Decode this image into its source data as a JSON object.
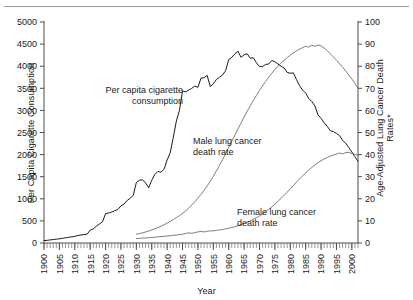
{
  "figure": {
    "top_rule": true,
    "background": "#ffffff"
  },
  "chart_data": {
    "type": "line",
    "title": "",
    "xlabel": "Year",
    "ylabel": "Per Capita Cigarette Consumption",
    "ylabel_right_line1": "Age-Adjusted Lung Cancer Death",
    "ylabel_right_line2": "Rates*",
    "xlim": [
      1900,
      2002
    ],
    "ylim": [
      0,
      5000
    ],
    "ylim_right": [
      0,
      100
    ],
    "grid": false,
    "legend": "inline-annotations",
    "xticks": [
      1900,
      1905,
      1910,
      1915,
      1920,
      1925,
      1930,
      1935,
      1940,
      1945,
      1950,
      1955,
      1960,
      1965,
      1970,
      1975,
      1980,
      1985,
      1990,
      1995,
      2000
    ],
    "xtick_labels": [
      "1900",
      "1905",
      "1910",
      "1915",
      "1920",
      "1925",
      "1930",
      "1935",
      "1940",
      "1945",
      "1950",
      "1955",
      "1960",
      "1965",
      "1970",
      "1975",
      "1980",
      "1985",
      "1990",
      "1995",
      "2000"
    ],
    "xtick_minor_step": 1,
    "yticks_left": [
      0,
      500,
      1000,
      1500,
      2000,
      2500,
      3000,
      3500,
      4000,
      4500,
      5000
    ],
    "ytick_labels_left": [
      "0",
      "500",
      "1000",
      "1500",
      "2000",
      "2500",
      "3000",
      "3500",
      "4000",
      "4500",
      "5000"
    ],
    "yticks_right": [
      0,
      10,
      20,
      30,
      40,
      50,
      60,
      70,
      80,
      90,
      100
    ],
    "ytick_labels_right": [
      "0",
      "10",
      "20",
      "30",
      "40",
      "50",
      "60",
      "70",
      "80",
      "90",
      "100"
    ],
    "series": [
      {
        "name": "Per capita cigarette consumption",
        "axis": "left",
        "color": "#1a1a1a",
        "x": [
          1900,
          1901,
          1902,
          1903,
          1904,
          1905,
          1906,
          1907,
          1908,
          1909,
          1910,
          1911,
          1912,
          1913,
          1914,
          1915,
          1916,
          1917,
          1918,
          1919,
          1920,
          1921,
          1922,
          1923,
          1924,
          1925,
          1926,
          1927,
          1928,
          1929,
          1930,
          1931,
          1932,
          1933,
          1934,
          1935,
          1936,
          1937,
          1938,
          1939,
          1940,
          1941,
          1942,
          1943,
          1944,
          1945,
          1946,
          1947,
          1948,
          1949,
          1950,
          1951,
          1952,
          1953,
          1954,
          1955,
          1956,
          1957,
          1958,
          1959,
          1960,
          1961,
          1962,
          1963,
          1964,
          1965,
          1966,
          1967,
          1968,
          1969,
          1970,
          1971,
          1972,
          1973,
          1974,
          1975,
          1976,
          1977,
          1978,
          1979,
          1980,
          1981,
          1982,
          1983,
          1984,
          1985,
          1986,
          1987,
          1988,
          1989,
          1990,
          1991,
          1992,
          1993,
          1994,
          1995,
          1996,
          1997,
          1998,
          1999,
          2000,
          2001,
          2002
        ],
        "y": [
          54,
          60,
          70,
          78,
          86,
          95,
          105,
          118,
          130,
          138,
          151,
          170,
          180,
          190,
          200,
          290,
          320,
          380,
          430,
          480,
          665,
          680,
          700,
          730,
          760,
          840,
          880,
          960,
          1010,
          1080,
          1370,
          1420,
          1430,
          1360,
          1250,
          1420,
          1550,
          1620,
          1600,
          1670,
          1880,
          2040,
          2390,
          2760,
          3000,
          3440,
          3420,
          3460,
          3500,
          3550,
          3520,
          3730,
          3740,
          3790,
          3540,
          3600,
          3700,
          3750,
          3800,
          3900,
          4150,
          4200,
          4280,
          4340,
          4200,
          4260,
          4280,
          4180,
          4190,
          4080,
          3990,
          3990,
          4040,
          4050,
          4130,
          4100,
          4050,
          4000,
          3960,
          3860,
          3840,
          3850,
          3700,
          3560,
          3460,
          3390,
          3270,
          3200,
          3100,
          2900,
          2820,
          2720,
          2640,
          2540,
          2520,
          2480,
          2430,
          2320,
          2260,
          2160,
          2060,
          1950,
          1850
        ],
        "label_line1": "Per capita cigarette",
        "label_line2": "consumption"
      },
      {
        "name": "Male lung cancer death rate",
        "axis": "right",
        "color": "#6e6e6e",
        "x": [
          1930,
          1931,
          1932,
          1933,
          1934,
          1935,
          1936,
          1937,
          1938,
          1939,
          1940,
          1941,
          1942,
          1943,
          1944,
          1945,
          1946,
          1947,
          1948,
          1949,
          1950,
          1951,
          1952,
          1953,
          1954,
          1955,
          1956,
          1957,
          1958,
          1959,
          1960,
          1961,
          1962,
          1963,
          1964,
          1965,
          1966,
          1967,
          1968,
          1969,
          1970,
          1971,
          1972,
          1973,
          1974,
          1975,
          1976,
          1977,
          1978,
          1979,
          1980,
          1981,
          1982,
          1983,
          1984,
          1985,
          1986,
          1987,
          1988,
          1989,
          1990,
          1991,
          1992,
          1993,
          1994,
          1995,
          1996,
          1997,
          1998,
          1999,
          2000,
          2001,
          2002
        ],
        "y": [
          4.0,
          4.3,
          4.6,
          5.0,
          5.4,
          5.9,
          6.4,
          7.0,
          7.6,
          8.3,
          9.0,
          9.8,
          10.6,
          11.5,
          12.4,
          13.4,
          14.5,
          15.8,
          17.2,
          18.7,
          20.3,
          22.0,
          23.8,
          25.8,
          27.9,
          30.2,
          32.6,
          35.1,
          37.7,
          40.4,
          43.2,
          46.0,
          48.8,
          51.6,
          54.3,
          57.0,
          59.6,
          62.1,
          64.5,
          66.8,
          69.0,
          71.1,
          73.1,
          75.0,
          76.8,
          78.5,
          80.0,
          81.4,
          82.7,
          83.9,
          85.0,
          86.0,
          86.9,
          87.7,
          88.4,
          89.0,
          88.6,
          89.5,
          89.0,
          89.6,
          89.2,
          88.2,
          87.0,
          85.6,
          84.2,
          82.7,
          81.1,
          79.5,
          77.8,
          76.0,
          74.2,
          72.3,
          70.0
        ],
        "label_line1": "Male lung cancer",
        "label_line2": "death rate"
      },
      {
        "name": "Female lung cancer death rate",
        "axis": "right",
        "color": "#6e6e6e",
        "x": [
          1930,
          1931,
          1932,
          1933,
          1934,
          1935,
          1936,
          1937,
          1938,
          1939,
          1940,
          1941,
          1942,
          1943,
          1944,
          1945,
          1946,
          1947,
          1948,
          1949,
          1950,
          1951,
          1952,
          1953,
          1954,
          1955,
          1956,
          1957,
          1958,
          1959,
          1960,
          1961,
          1962,
          1963,
          1964,
          1965,
          1966,
          1967,
          1968,
          1969,
          1970,
          1971,
          1972,
          1973,
          1974,
          1975,
          1976,
          1977,
          1978,
          1979,
          1980,
          1981,
          1982,
          1983,
          1984,
          1985,
          1986,
          1987,
          1988,
          1989,
          1990,
          1991,
          1992,
          1993,
          1994,
          1995,
          1996,
          1997,
          1998,
          1999,
          2000,
          2001,
          2002
        ],
        "y": [
          2.0,
          2.1,
          2.2,
          2.3,
          2.4,
          2.5,
          2.6,
          2.8,
          2.9,
          3.0,
          3.2,
          3.3,
          3.5,
          3.6,
          3.8,
          4.0,
          4.3,
          4.6,
          4.4,
          4.7,
          5.0,
          5.2,
          5.0,
          5.3,
          5.5,
          5.5,
          5.7,
          5.9,
          6.1,
          6.4,
          6.7,
          7.0,
          7.4,
          7.8,
          8.3,
          8.8,
          9.4,
          10.0,
          10.7,
          11.5,
          12.3,
          13.2,
          14.2,
          15.3,
          16.4,
          17.6,
          18.9,
          20.2,
          21.6,
          23.0,
          24.5,
          26.0,
          27.5,
          29.0,
          30.4,
          31.8,
          33.0,
          34.2,
          35.3,
          36.3,
          37.2,
          38.0,
          38.7,
          39.3,
          39.8,
          40.2,
          40.7,
          40.3,
          40.9,
          41.0,
          40.5,
          40.2,
          39.6
        ],
        "label_line1": "Female lung cancer",
        "label_line2": "death rate"
      }
    ],
    "annotations": [
      {
        "id": "annot-cigarette",
        "line1": "Per capita cigarette",
        "line2": "consumption",
        "anchor": "end"
      },
      {
        "id": "annot-male",
        "line1": "Male lung cancer",
        "line2": "death rate",
        "anchor": "start"
      },
      {
        "id": "annot-female",
        "line1": "Female lung cancer",
        "line2": "death rate",
        "anchor": "start"
      }
    ]
  }
}
